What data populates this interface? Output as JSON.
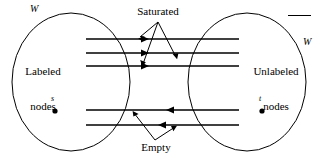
{
  "figure": {
    "kind": "max-flow-min-cut-labeling-diagram",
    "background_color": "#ffffff",
    "stroke_color": "#000000",
    "sets": {
      "left": {
        "symbol": "W",
        "caption_line1": "Labeled",
        "caption_line2": "nodes",
        "node_label": "s"
      },
      "right": {
        "symbol": "W",
        "symbol_has_overbar": true,
        "caption_line1": "Unlabeled",
        "caption_line2": "nodes",
        "node_label": "t"
      }
    },
    "callouts": {
      "top": "Saturated",
      "bottom": "Empty"
    },
    "arcs": {
      "saturated_count": 3,
      "saturated_direction": "right",
      "empty_count": 2,
      "empty_direction": "left"
    }
  }
}
